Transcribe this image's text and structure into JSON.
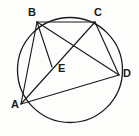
{
  "figure": {
    "type": "circle-geometry-diagram",
    "background_color": "#fdfdfc",
    "stroke_color": "#1a1a1a",
    "label_color": "#1a1a1a",
    "width": 139,
    "height": 136,
    "circle": {
      "cx": 70,
      "cy": 70,
      "r": 52.5,
      "stroke_width": 1.3
    },
    "points": [
      {
        "id": "A",
        "label": "A",
        "x": 21,
        "y": 104,
        "label_x": 11,
        "label_y": 99
      },
      {
        "id": "B",
        "label": "B",
        "x": 37,
        "y": 22,
        "label_x": 28,
        "label_y": 7
      },
      {
        "id": "C",
        "label": "C",
        "x": 95,
        "y": 22,
        "label_x": 94,
        "label_y": 7
      },
      {
        "id": "D",
        "label": "D",
        "x": 119,
        "y": 75,
        "label_x": 123,
        "label_y": 68
      },
      {
        "id": "E",
        "label": "E",
        "x": 52,
        "y": 67,
        "label_x": 58,
        "label_y": 63
      }
    ],
    "segments": [
      {
        "id": "AB",
        "from": "A",
        "to": "B"
      },
      {
        "id": "AC",
        "from": "A",
        "to": "C"
      },
      {
        "id": "AD",
        "from": "A",
        "to": "D"
      },
      {
        "id": "BC",
        "from": "B",
        "to": "C"
      },
      {
        "id": "BD",
        "from": "B",
        "to": "D"
      },
      {
        "id": "BE",
        "from": "B",
        "to": "E"
      },
      {
        "id": "CD",
        "from": "C",
        "to": "D"
      }
    ]
  }
}
